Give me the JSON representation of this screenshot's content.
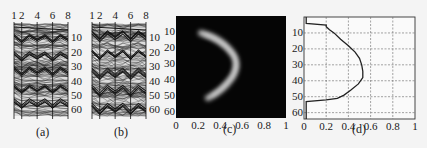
{
  "figure": {
    "captions": [
      "(a)",
      "(b)",
      "(c)",
      "(d)"
    ]
  },
  "chart_data": [
    {
      "id": "a",
      "type": "line",
      "title": "",
      "caption": "(a)",
      "xlabel": "",
      "ylabel": "",
      "x_ticks": [
        "1",
        "2",
        "4",
        "6",
        "8"
      ],
      "y_ticks": [
        "10",
        "20",
        "30",
        "40",
        "50",
        "60"
      ],
      "xlim": [
        1,
        8
      ],
      "ylim": [
        0,
        64
      ],
      "description": "Dense overlaid wavy line traces across 64 rows, darker bands near rows 10, 22, 33, 45, 55"
    },
    {
      "id": "b",
      "type": "line",
      "title": "",
      "caption": "(b)",
      "xlabel": "",
      "ylabel": "",
      "x_ticks": [
        "1",
        "2",
        "4",
        "6",
        "8"
      ],
      "y_ticks": [
        "10",
        "20",
        "30",
        "40",
        "50",
        "60"
      ],
      "xlim": [
        1,
        8
      ],
      "ylim": [
        0,
        64
      ],
      "description": "Dense overlaid wavy line traces with sharper dark bands near rows 8, 20, 34, 46, 58"
    },
    {
      "id": "c",
      "type": "heatmap",
      "title": "",
      "caption": "(c)",
      "x_ticks": [
        "0",
        "0.2",
        "0.4",
        "0.6",
        "0.8",
        "1"
      ],
      "y_ticks": [
        "10",
        "20",
        "30",
        "40",
        "50",
        "60"
      ],
      "xlim": [
        0,
        1
      ],
      "ylim": [
        0,
        64
      ],
      "description": "Black background with bright crescent arc opening left, spanning y≈8 to y≈56, apex near x≈0.55 at y≈32"
    },
    {
      "id": "d",
      "type": "line",
      "title": "",
      "caption": "(d)",
      "x_ticks": [
        "0",
        "0.2",
        "0.4",
        "0.6",
        "0.8",
        "1"
      ],
      "y_ticks": [
        "10",
        "20",
        "30",
        "40",
        "50",
        "60"
      ],
      "xlim": [
        0,
        1
      ],
      "ylim": [
        0,
        64
      ],
      "grid": true,
      "series": [
        {
          "name": "profile",
          "y": [
            0,
            4,
            5,
            6,
            8,
            10,
            14,
            18,
            22,
            26,
            30,
            34,
            38,
            42,
            46,
            49,
            51,
            52,
            53,
            64
          ],
          "x": [
            0.02,
            0.02,
            0.2,
            0.2,
            0.23,
            0.27,
            0.33,
            0.4,
            0.46,
            0.5,
            0.52,
            0.53,
            0.53,
            0.49,
            0.42,
            0.36,
            0.3,
            0.2,
            0.02,
            0.02
          ]
        }
      ]
    }
  ]
}
